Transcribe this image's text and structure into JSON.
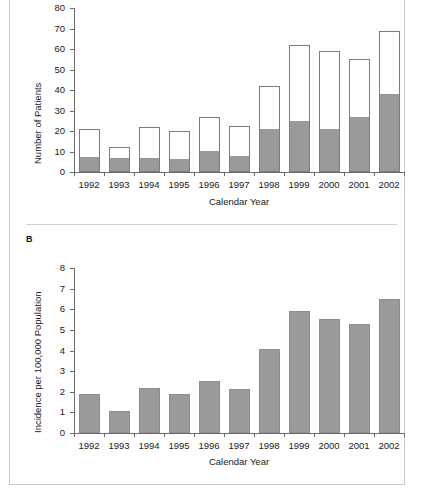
{
  "figure": {
    "panels": [
      {
        "letter": "",
        "letter_visible": false
      },
      {
        "letter": "B",
        "letter_visible": true
      }
    ]
  },
  "chart_data": [
    {
      "type": "bar",
      "panel": "A",
      "stacked": true,
      "title": "",
      "xlabel": "Calendar Year",
      "ylabel": "Number of Patients",
      "categories": [
        "1992",
        "1993",
        "1994",
        "1995",
        "1996",
        "1997",
        "1998",
        "1999",
        "2000",
        "2001",
        "2002"
      ],
      "ylim": [
        0,
        80
      ],
      "yticks": [
        0,
        10,
        20,
        30,
        40,
        50,
        60,
        70,
        80
      ],
      "grid": false,
      "legend": "none",
      "series": [
        {
          "name": "Lower (shaded) segment",
          "color": "#9a9a9a",
          "values": [
            7.5,
            7,
            7,
            6.5,
            10,
            8,
            21,
            25,
            21,
            27,
            38
          ]
        },
        {
          "name": "Upper (open) segment",
          "color": "#ffffff",
          "values": [
            13.5,
            5,
            15,
            13.5,
            17,
            14.5,
            21,
            37,
            38,
            28,
            31
          ]
        }
      ],
      "totals": [
        21,
        12,
        22,
        20,
        27,
        22.5,
        42,
        62,
        59,
        55,
        69
      ]
    },
    {
      "type": "bar",
      "panel": "B",
      "stacked": false,
      "title": "",
      "xlabel": "Calendar Year",
      "ylabel": "Incidence per 100,000 Population",
      "categories": [
        "1992",
        "1993",
        "1994",
        "1995",
        "1996",
        "1997",
        "1998",
        "1999",
        "2000",
        "2001",
        "2002"
      ],
      "ylim": [
        0,
        8
      ],
      "yticks": [
        0,
        1,
        2,
        3,
        4,
        5,
        6,
        7,
        8
      ],
      "grid": false,
      "legend": "none",
      "series": [
        {
          "name": "Incidence",
          "color": "#9a9a9a",
          "values": [
            1.9,
            1.05,
            2.2,
            1.9,
            2.5,
            2.15,
            4.05,
            5.9,
            5.55,
            5.3,
            6.5
          ]
        }
      ]
    }
  ]
}
